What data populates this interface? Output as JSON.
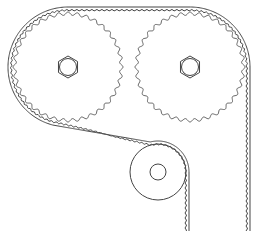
{
  "diagram": {
    "type": "timing-belt-drive",
    "components": [
      {
        "id": "left-pulley",
        "kind": "toothed-pulley",
        "cx": 68,
        "cy": 67,
        "r": 55,
        "teeth": 36,
        "hub": "hex-nut"
      },
      {
        "id": "right-pulley",
        "kind": "toothed-pulley",
        "cx": 190,
        "cy": 67,
        "r": 55,
        "teeth": 36,
        "hub": "hex-nut"
      },
      {
        "id": "idler",
        "kind": "idler-roller",
        "cx": 158,
        "cy": 172,
        "r": 28,
        "hub_r": 8
      },
      {
        "id": "belt",
        "kind": "toothed-belt"
      }
    ],
    "colors": {
      "line": "#444444",
      "background": "#ffffff"
    }
  }
}
